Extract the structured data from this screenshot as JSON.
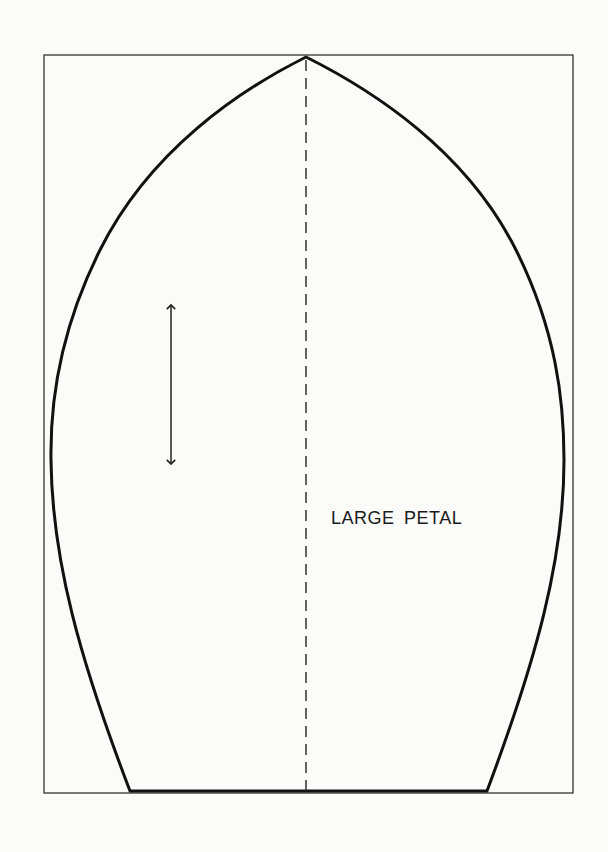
{
  "pattern": {
    "piece_label": "LARGE PETAL",
    "colors": {
      "background": "#fbfbfa",
      "outline": "#111111",
      "frame": "#333333"
    },
    "frame": {
      "x": 44,
      "y": 55,
      "width": 529,
      "height": 738
    },
    "petal": {
      "tip": [
        306,
        57
      ],
      "base_left": [
        130,
        791
      ],
      "base_right": [
        487,
        791
      ],
      "widest_left": [
        51,
        460
      ],
      "widest_right": [
        564,
        460
      ]
    },
    "center_fold_line": {
      "x": 306,
      "y1": 60,
      "y2": 791,
      "style": "dashed"
    },
    "grain_arrow": {
      "x": 171,
      "y1": 302,
      "y2": 466,
      "style": "double-headed"
    }
  }
}
